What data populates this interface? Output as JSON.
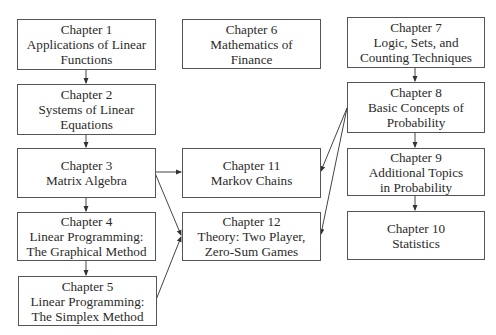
{
  "diagram": {
    "nodes": [
      {
        "id": "ch1",
        "heading": "Chapter 1",
        "lines": [
          "Applications of Linear",
          "Functions"
        ]
      },
      {
        "id": "ch2",
        "heading": "Chapter 2",
        "lines": [
          "Systems of Linear",
          "Equations"
        ]
      },
      {
        "id": "ch3",
        "heading": "Chapter 3",
        "lines": [
          "Matrix Algebra"
        ]
      },
      {
        "id": "ch4",
        "heading": "Chapter 4",
        "lines": [
          "Linear Programming:",
          "The Graphical Method"
        ]
      },
      {
        "id": "ch5",
        "heading": "Chapter 5",
        "lines": [
          "Linear Programming:",
          "The Simplex Method"
        ]
      },
      {
        "id": "ch6",
        "heading": "Chapter 6",
        "lines": [
          "Mathematics of",
          "Finance"
        ]
      },
      {
        "id": "ch7",
        "heading": "Chapter 7",
        "lines": [
          "Logic, Sets, and",
          "Counting Techniques"
        ]
      },
      {
        "id": "ch8",
        "heading": "Chapter 8",
        "lines": [
          "Basic Concepts of",
          "Probability"
        ]
      },
      {
        "id": "ch9",
        "heading": "Chapter 9",
        "lines": [
          "Additional Topics",
          "in Probability"
        ]
      },
      {
        "id": "ch10",
        "heading": "Chapter 10",
        "lines": [
          "Statistics"
        ]
      },
      {
        "id": "ch11",
        "heading": "Chapter 11",
        "lines": [
          "Markov Chains"
        ]
      },
      {
        "id": "ch12",
        "heading": "Chapter 12",
        "lines": [
          "Theory: Two Player,",
          "Zero-Sum Games"
        ]
      }
    ],
    "edges": [
      {
        "from": "ch1",
        "to": "ch2"
      },
      {
        "from": "ch2",
        "to": "ch3"
      },
      {
        "from": "ch3",
        "to": "ch4"
      },
      {
        "from": "ch4",
        "to": "ch5"
      },
      {
        "from": "ch3",
        "to": "ch11"
      },
      {
        "from": "ch3",
        "to": "ch12"
      },
      {
        "from": "ch5",
        "to": "ch12"
      },
      {
        "from": "ch7",
        "to": "ch8"
      },
      {
        "from": "ch8",
        "to": "ch9"
      },
      {
        "from": "ch9",
        "to": "ch10"
      },
      {
        "from": "ch8",
        "to": "ch11"
      },
      {
        "from": "ch8",
        "to": "ch12"
      }
    ]
  }
}
